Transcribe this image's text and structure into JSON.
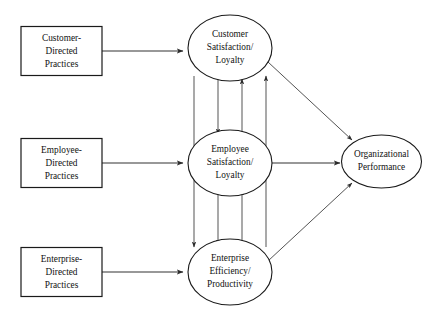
{
  "diagram": {
    "background_color": "#ffffff",
    "line_color": "#333333",
    "text_color": "#111111",
    "boxes": [
      {
        "id": "customer-directed-practices",
        "lines": [
          "Customer-",
          "Directed",
          "Practices"
        ],
        "line1": "Customer-",
        "line2": "Directed",
        "line3": "Practices"
      },
      {
        "id": "employee-directed-practices",
        "lines": [
          "Employee-",
          "Directed",
          "Practices"
        ],
        "line1": "Employee-",
        "line2": "Directed",
        "line3": "Practices"
      },
      {
        "id": "enterprise-directed-practices",
        "lines": [
          "Enterprise-",
          "Directed",
          "Practices"
        ],
        "line1": "Enterprise-",
        "line2": "Directed",
        "line3": "Practices"
      }
    ],
    "ellipses": [
      {
        "id": "customer-satisfaction-loyalty",
        "lines": [
          "Customer",
          "Satisfaction/",
          "Loyalty"
        ],
        "line1": "Customer",
        "line2": "Satisfaction/",
        "line3": "Loyalty"
      },
      {
        "id": "employee-satisfaction-loyalty",
        "lines": [
          "Employee",
          "Satisfaction/",
          "Loyalty"
        ],
        "line1": "Employee",
        "line2": "Satisfaction/",
        "line3": "Loyalty"
      },
      {
        "id": "enterprise-efficiency-productivity",
        "lines": [
          "Enterprise",
          "Efficiency/",
          "Productivity"
        ],
        "line1": "Enterprise",
        "line2": "Efficiency/",
        "line3": "Productivity"
      },
      {
        "id": "organizational-performance",
        "lines": [
          "Organizational",
          "Performance"
        ],
        "line1": "Organizational",
        "line2": "Performance"
      }
    ],
    "edges": [
      {
        "id": "customer-practices-to-customer-satisfaction",
        "from": "customer-directed-practices",
        "to": "customer-satisfaction-loyalty",
        "style": "horizontal-arrow"
      },
      {
        "id": "employee-practices-to-employee-satisfaction",
        "from": "employee-directed-practices",
        "to": "employee-satisfaction-loyalty",
        "style": "horizontal-arrow"
      },
      {
        "id": "enterprise-practices-to-enterprise-efficiency",
        "from": "enterprise-directed-practices",
        "to": "enterprise-efficiency-productivity",
        "style": "horizontal-arrow"
      },
      {
        "id": "customer-satisfaction-to-employee-satisfaction",
        "from": "customer-satisfaction-loyalty",
        "to": "employee-satisfaction-loyalty",
        "style": "vertical-arrow-down"
      },
      {
        "id": "employee-satisfaction-to-customer-satisfaction",
        "from": "employee-satisfaction-loyalty",
        "to": "customer-satisfaction-loyalty",
        "style": "vertical-arrow-up"
      },
      {
        "id": "employee-satisfaction-to-enterprise-efficiency",
        "from": "employee-satisfaction-loyalty",
        "to": "enterprise-efficiency-productivity",
        "style": "vertical-arrow-down"
      },
      {
        "id": "enterprise-efficiency-to-employee-satisfaction",
        "from": "enterprise-efficiency-productivity",
        "to": "employee-satisfaction-loyalty",
        "style": "vertical-arrow-up"
      },
      {
        "id": "customer-satisfaction-to-enterprise-efficiency",
        "from": "customer-satisfaction-loyalty",
        "to": "enterprise-efficiency-productivity",
        "style": "vertical-arrow-down-long"
      },
      {
        "id": "enterprise-efficiency-to-customer-satisfaction",
        "from": "enterprise-efficiency-productivity",
        "to": "customer-satisfaction-loyalty",
        "style": "vertical-arrow-up-long"
      },
      {
        "id": "customer-satisfaction-to-organizational-performance",
        "from": "customer-satisfaction-loyalty",
        "to": "organizational-performance",
        "style": "diagonal-arrow"
      },
      {
        "id": "employee-satisfaction-to-organizational-performance",
        "from": "employee-satisfaction-loyalty",
        "to": "organizational-performance",
        "style": "horizontal-arrow"
      },
      {
        "id": "enterprise-efficiency-to-organizational-performance",
        "from": "enterprise-efficiency-productivity",
        "to": "organizational-performance",
        "style": "diagonal-arrow"
      }
    ]
  }
}
